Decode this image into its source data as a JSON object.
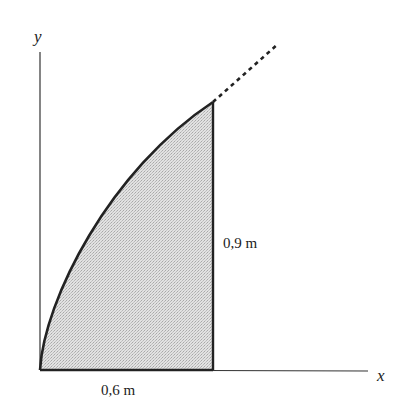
{
  "diagram": {
    "axes": {
      "x_label": "x",
      "y_label": "y"
    },
    "dimensions": {
      "width_label": "0,6 m",
      "height_label": "0,9 m"
    },
    "colors": {
      "line": "#222222",
      "fill": "#d6d6d6",
      "background": "#ffffff"
    }
  }
}
